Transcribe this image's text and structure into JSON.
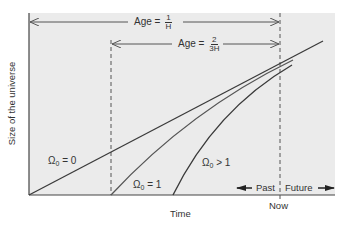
{
  "diagram": {
    "y_axis_label": "Size of the universe",
    "x_axis_label": "Time",
    "now_label": "Now",
    "past_label": "Past",
    "future_label": "Future",
    "age_markers": [
      {
        "prefix": "Age =",
        "numerator": "1",
        "denominator": "H"
      },
      {
        "prefix": "Age =",
        "numerator": "2",
        "denominator": "3H"
      }
    ],
    "curves": [
      {
        "label_symbol": "Ω",
        "label_sub": "0",
        "label_rel": "= 0",
        "description": "Omega_0 = 0 straight line"
      },
      {
        "label_symbol": "Ω",
        "label_sub": "0",
        "label_rel": "= 1",
        "description": "Omega_0 = 1 curve"
      },
      {
        "label_symbol": "Ω",
        "label_sub": "0",
        "label_rel": "> 1",
        "description": "Omega_0 > 1 curve"
      }
    ],
    "colors": {
      "background": "#ebebeb",
      "line": "#3a3a3a",
      "dashed": "#555555"
    }
  }
}
